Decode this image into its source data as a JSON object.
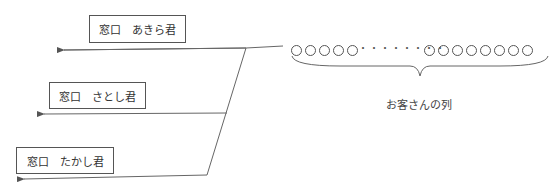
{
  "windows": [
    {
      "label": "窓口　あきら君"
    },
    {
      "label": "窓口　さとし君"
    },
    {
      "label": "窓口　たかし君"
    }
  ],
  "queue": {
    "left_group_count": 5,
    "ellipsis": "・・・・・・・・",
    "right_group_count": 8,
    "label": "お客さんの列"
  }
}
